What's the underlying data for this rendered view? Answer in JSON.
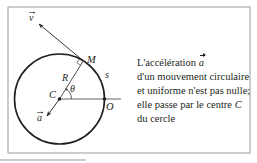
{
  "figure": {
    "labels": {
      "velocity": "v",
      "acceleration": "a",
      "point_moving": "M",
      "center": "C",
      "origin_point": "O",
      "radius": "R",
      "arc_length": "s",
      "angle": "θ"
    },
    "colors": {
      "ink": "#231f20",
      "frame": "#9a9a9a"
    }
  },
  "caption": {
    "line1_prefix": "L'accélération ",
    "line1_vector": "a",
    "line2": "d'un mouvement circulaire",
    "line3": "et uniforme n'est pas nulle;",
    "line4_prefix": "elle passe par le centre ",
    "line4_symbol": "C",
    "line5": "du cercle"
  }
}
